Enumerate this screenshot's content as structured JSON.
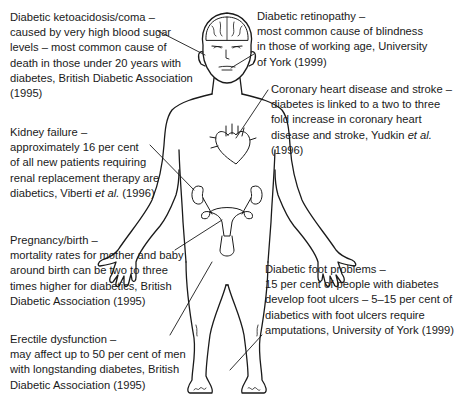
{
  "figure": {
    "organs": [
      "brain",
      "eyes",
      "heart",
      "kidneys",
      "uterus",
      "genitals",
      "feet"
    ]
  },
  "callouts": {
    "ketoacidosis": {
      "title": "Diabetic ketoacidosis/coma –",
      "lines": [
        "caused by very high blood sugar",
        "levels – most common cause of",
        "death in those under 20 years with",
        "diabetes, British Diabetic Association",
        "(1995)"
      ]
    },
    "retinopathy": {
      "title": "Diabetic retinopathy –",
      "lines": [
        "most common cause of blindness",
        "in those of working age, University",
        "of York (1999)"
      ]
    },
    "heart": {
      "title": "Coronary heart disease and stroke –",
      "lines": [
        "diabetes is linked to a two to three",
        "fold increase in coronary heart"
      ],
      "line4_prefix": "disease and stroke, Yudkin ",
      "line4_italic": "et al.",
      "line5": "(1996)"
    },
    "kidney": {
      "title": "Kidney failure –",
      "lines": [
        "approximately 16 per cent",
        "of all new patients requiring",
        "renal replacement therapy are"
      ],
      "line5_prefix": "diabetics, Viberti ",
      "line5_italic": "et al.",
      "line5_suffix": " (1996)"
    },
    "pregnancy": {
      "title": "Pregnancy/birth –",
      "lines": [
        "mortality rates for mother and baby",
        "around birth can be two to three",
        "times higher for diabetics, British",
        "Diabetic Association (1995)"
      ]
    },
    "foot": {
      "title": "Diabetic foot problems –",
      "lines": [
        "15 per cent of people with diabetes",
        "develop foot ulcers – 5–15 per cent of",
        "diabetics with foot ulcers require",
        "amputations, University of York (1999)"
      ]
    },
    "erectile": {
      "title": "Erectile dysfunction –",
      "lines": [
        "may affect up to 50 per cent of men",
        "with longstanding diabetes, British",
        "Diabetic Association (1995)"
      ]
    }
  },
  "colors": {
    "ink": "#1a1a1a",
    "background": "#ffffff"
  }
}
